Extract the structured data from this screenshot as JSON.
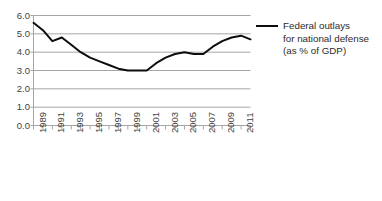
{
  "chart_data": {
    "type": "line",
    "title": "",
    "subtitle": "",
    "xlabel": "",
    "ylabel": "",
    "xlim": [
      1989,
      2012
    ],
    "ylim": [
      0.0,
      6.0
    ],
    "grid": true,
    "grid_axis": "y",
    "legend_position": "right",
    "series": [
      {
        "name": "Federal outlays for national defense (as % of GDP)",
        "color": "#0d0d0d",
        "x": [
          1989,
          1990,
          1991,
          1992,
          1993,
          1994,
          1995,
          1996,
          1997,
          1998,
          1999,
          2000,
          2001,
          2002,
          2003,
          2004,
          2005,
          2006,
          2007,
          2008,
          2009,
          2010,
          2011,
          2012
        ],
        "values": [
          5.6,
          5.2,
          4.6,
          4.8,
          4.4,
          4.0,
          3.7,
          3.5,
          3.3,
          3.1,
          3.0,
          3.0,
          3.0,
          3.4,
          3.7,
          3.9,
          4.0,
          3.9,
          3.9,
          4.3,
          4.6,
          4.8,
          4.9,
          4.7
        ]
      }
    ],
    "y_ticks": [
      "0.0",
      "1.0",
      "2.0",
      "3.0",
      "4.0",
      "5.0",
      "6.0"
    ],
    "y_tick_values": [
      0.0,
      1.0,
      2.0,
      3.0,
      4.0,
      5.0,
      6.0
    ],
    "x_ticks": [
      "1989",
      "1991",
      "1993",
      "1995",
      "1997",
      "1999",
      "2001",
      "2003",
      "2005",
      "2007",
      "2009",
      "2011"
    ],
    "x_tick_values": [
      1989,
      1991,
      1993,
      1995,
      1997,
      1999,
      2001,
      2003,
      2005,
      2007,
      2009,
      2011
    ],
    "x_minor_tick_values": [
      1989,
      1990,
      1991,
      1992,
      1993,
      1994,
      1995,
      1996,
      1997,
      1998,
      1999,
      2000,
      2001,
      2002,
      2003,
      2004,
      2005,
      2006,
      2007,
      2008,
      2009,
      2010,
      2011,
      2012
    ]
  },
  "legend": {
    "label": "Federal outlays\nfor national defense\n(as % of GDP)",
    "swatch_color": "#0d0d0d"
  },
  "colors": {
    "line": "#0d0d0d",
    "gridline": "#a6a6a6",
    "axis": "#a6a6a6",
    "tick_text": "#3f3f3f",
    "background": "#ffffff"
  }
}
